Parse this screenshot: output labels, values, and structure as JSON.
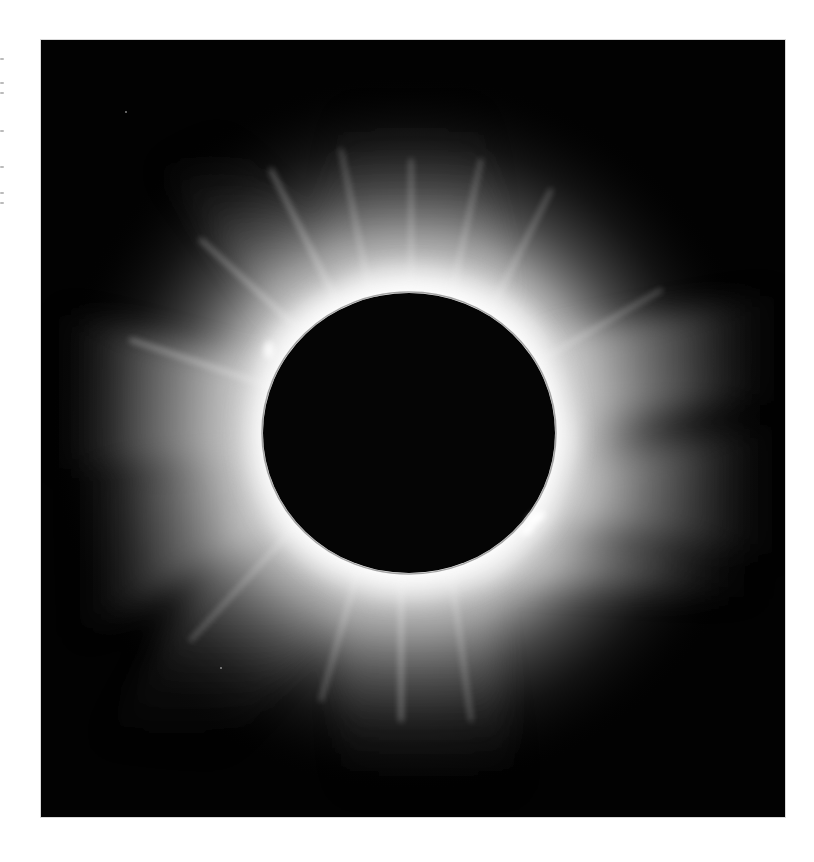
{
  "photo": {
    "subject": "Total solar eclipse",
    "description": "Solar corona surrounding the dark lunar disc, with streamers and a prominence at lower right",
    "colors": {
      "background": "#020202",
      "moon": "#050505",
      "corona_core": "#ffffff",
      "corona_mid": "#bfbfbf",
      "corona_outer": "#3a3a3a",
      "page": "#ffffff"
    },
    "moon": {
      "center_x": 368,
      "center_y": 393,
      "radius_x": 146,
      "radius_y": 140
    }
  },
  "margin_text_fragments": [
    "·",
    "·",
    "·",
    "·",
    "·",
    "·",
    "·"
  ]
}
